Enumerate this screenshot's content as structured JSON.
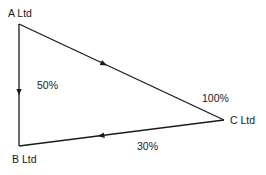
{
  "diagram": {
    "type": "ownership-triangle",
    "nodes": [
      {
        "id": "A",
        "label": "A Ltd",
        "x": 19,
        "y": 24
      },
      {
        "id": "B",
        "label": "B Ltd",
        "x": 19,
        "y": 146
      },
      {
        "id": "C",
        "label": "C Ltd",
        "x": 224,
        "y": 120
      }
    ],
    "edges": [
      {
        "from": "A",
        "to": "B",
        "label": "50%"
      },
      {
        "from": "A",
        "to": "C",
        "label": "100%"
      },
      {
        "from": "C",
        "to": "B",
        "label": "30%"
      }
    ],
    "colors": {
      "line": "#1a1a1a",
      "text": "#1a1a1a",
      "background": "#ffffff"
    }
  }
}
